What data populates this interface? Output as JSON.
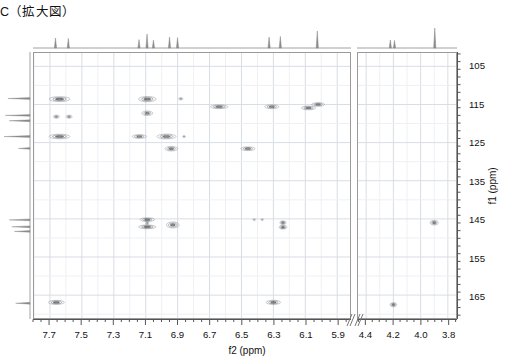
{
  "title": "C（拡大図）",
  "axes": {
    "f2_title": "f2 (ppm)",
    "f1_title": "f1 (ppm)",
    "f2_left": {
      "min": 5.82,
      "max": 7.8,
      "ticks": [
        7.7,
        7.5,
        7.3,
        7.1,
        6.9,
        6.7,
        6.5,
        6.3,
        6.1,
        5.9
      ],
      "minor_step": 0.05
    },
    "f2_right": {
      "min": 3.74,
      "max": 4.46,
      "ticks": [
        4.4,
        4.2,
        4.0,
        3.8
      ],
      "minor_step": 0.05
    },
    "f1": {
      "min": 101.5,
      "max": 171.0,
      "ticks": [
        105,
        115,
        125,
        135,
        145,
        155,
        165
      ],
      "minor_step": 2
    },
    "break_marker": "axis-break"
  },
  "chart_data": {
    "type": "scatter",
    "title": "C（拡大図）",
    "xlabel": "f2 (ppm)",
    "ylabel": "f1 (ppm)",
    "xlim_left": [
      7.8,
      5.82
    ],
    "xlim_right": [
      4.46,
      3.74
    ],
    "ylim": [
      171.0,
      101.5
    ],
    "grid": true,
    "legend": "none",
    "note": "2D HMBC contour cross peaks; x = 1H shift (ppm), y = 13C shift (ppm), w/h = contour extent in ppm",
    "peaks_left": [
      {
        "x": 7.64,
        "y": 113.6,
        "w": 0.13,
        "h": 1.3,
        "i": 0.85
      },
      {
        "x": 7.09,
        "y": 113.6,
        "w": 0.11,
        "h": 1.4,
        "i": 0.85
      },
      {
        "x": 6.88,
        "y": 113.5,
        "w": 0.03,
        "h": 0.7,
        "i": 0.45
      },
      {
        "x": 7.66,
        "y": 118.2,
        "w": 0.04,
        "h": 0.9,
        "i": 0.6
      },
      {
        "x": 7.58,
        "y": 118.2,
        "w": 0.04,
        "h": 0.9,
        "i": 0.6
      },
      {
        "x": 7.09,
        "y": 117.3,
        "w": 0.07,
        "h": 1.2,
        "i": 0.75
      },
      {
        "x": 7.64,
        "y": 123.4,
        "w": 0.13,
        "h": 1.2,
        "i": 0.85
      },
      {
        "x": 7.14,
        "y": 123.4,
        "w": 0.09,
        "h": 1.0,
        "i": 0.75
      },
      {
        "x": 6.97,
        "y": 123.4,
        "w": 0.12,
        "h": 1.3,
        "i": 0.8
      },
      {
        "x": 6.86,
        "y": 123.4,
        "w": 0.02,
        "h": 0.5,
        "i": 0.4
      },
      {
        "x": 6.94,
        "y": 126.6,
        "w": 0.08,
        "h": 1.2,
        "i": 0.8
      },
      {
        "x": 6.46,
        "y": 126.6,
        "w": 0.09,
        "h": 1.0,
        "i": 0.75
      },
      {
        "x": 6.64,
        "y": 115.6,
        "w": 0.11,
        "h": 1.0,
        "i": 0.8
      },
      {
        "x": 6.31,
        "y": 115.6,
        "w": 0.09,
        "h": 1.0,
        "i": 0.75
      },
      {
        "x": 6.08,
        "y": 115.9,
        "w": 0.09,
        "h": 1.0,
        "i": 0.8
      },
      {
        "x": 6.02,
        "y": 115.0,
        "w": 0.08,
        "h": 1.0,
        "i": 0.75
      },
      {
        "x": 7.09,
        "y": 145.2,
        "w": 0.09,
        "h": 1.0,
        "i": 0.8
      },
      {
        "x": 7.09,
        "y": 147.1,
        "w": 0.11,
        "h": 1.0,
        "i": 0.85
      },
      {
        "x": 7.09,
        "y": 146.1,
        "w": 0.02,
        "h": 1.2,
        "i": 0.45
      },
      {
        "x": 6.93,
        "y": 146.6,
        "w": 0.08,
        "h": 1.6,
        "i": 0.8
      },
      {
        "x": 6.42,
        "y": 145.2,
        "w": 0.02,
        "h": 0.5,
        "i": 0.3
      },
      {
        "x": 6.37,
        "y": 145.2,
        "w": 0.02,
        "h": 0.5,
        "i": 0.3
      },
      {
        "x": 6.24,
        "y": 146.0,
        "w": 0.04,
        "h": 1.0,
        "i": 0.75
      },
      {
        "x": 6.24,
        "y": 147.2,
        "w": 0.05,
        "h": 1.0,
        "i": 0.85
      },
      {
        "x": 7.66,
        "y": 166.9,
        "w": 0.1,
        "h": 1.1,
        "i": 0.85
      },
      {
        "x": 6.3,
        "y": 166.9,
        "w": 0.09,
        "h": 1.1,
        "i": 0.85
      }
    ],
    "peaks_right": [
      {
        "x": 3.9,
        "y": 146.0,
        "w": 0.06,
        "h": 1.2,
        "i": 0.85
      },
      {
        "x": 4.2,
        "y": 167.5,
        "w": 0.05,
        "h": 1.1,
        "i": 0.8
      }
    ],
    "projection_f2_left": [
      {
        "x": 7.66,
        "h": 0.5
      },
      {
        "x": 7.58,
        "h": 0.48
      },
      {
        "x": 7.14,
        "h": 0.42
      },
      {
        "x": 7.09,
        "h": 0.7
      },
      {
        "x": 7.05,
        "h": 0.4
      },
      {
        "x": 6.95,
        "h": 0.55
      },
      {
        "x": 6.9,
        "h": 0.52
      },
      {
        "x": 6.33,
        "h": 0.55
      },
      {
        "x": 6.26,
        "h": 0.58
      },
      {
        "x": 6.03,
        "h": 0.85
      }
    ],
    "projection_f2_right": [
      {
        "x": 4.22,
        "h": 0.4
      },
      {
        "x": 4.19,
        "h": 0.38
      },
      {
        "x": 3.9,
        "h": 1.0
      }
    ],
    "projection_f1": [
      {
        "y": 113.6,
        "h": 0.85
      },
      {
        "y": 118.0,
        "h": 0.95
      },
      {
        "y": 119.4,
        "h": 0.8
      },
      {
        "y": 123.5,
        "h": 1.0
      },
      {
        "y": 126.6,
        "h": 0.45
      },
      {
        "y": 145.2,
        "h": 0.8
      },
      {
        "y": 147.0,
        "h": 0.7
      },
      {
        "y": 148.2,
        "h": 0.6
      },
      {
        "y": 166.9,
        "h": 0.55
      }
    ]
  },
  "colors": {
    "frame": "#9a9a9a",
    "grid": "#d8dce4",
    "peak": "#555a60",
    "trace": "#8a8a8a",
    "text": "#111111"
  }
}
